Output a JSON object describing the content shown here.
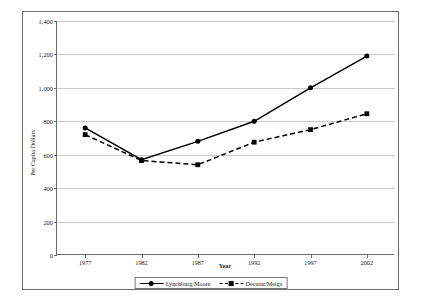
{
  "chart_data": {
    "type": "line",
    "title": "",
    "xlabel": "Year",
    "ylabel": "Per Capita Dollars",
    "categories": [
      "1977",
      "1982",
      "1987",
      "1992",
      "1997",
      "2002"
    ],
    "x": [
      1977,
      1982,
      1987,
      1992,
      1997,
      2002
    ],
    "ylim": [
      0,
      1400
    ],
    "ytick_values": [
      0,
      200,
      400,
      600,
      800,
      1000,
      1200,
      1400
    ],
    "ytick_labels": [
      "0",
      "200",
      "400",
      "600",
      "800",
      "1,000",
      "1,200",
      "1,400"
    ],
    "grid": true,
    "legend_position": "bottom-center",
    "series": [
      {
        "name": "Lynchburg/Moore",
        "values": [
          760,
          570,
          680,
          800,
          1000,
          1190
        ],
        "line_style": "solid",
        "marker": "circle",
        "color": "#000000"
      },
      {
        "name": "Decatur/Meigs",
        "values": [
          720,
          565,
          540,
          675,
          750,
          845
        ],
        "line_style": "dashed",
        "marker": "square",
        "color": "#000000"
      }
    ]
  },
  "axes": {
    "y_title": "Per Capita Dollars",
    "x_title": "Year"
  },
  "colors": {
    "frame": "#6b6b6b",
    "gridline": "#c9c9c9",
    "ink": "#000000",
    "background": "#ffffff"
  }
}
